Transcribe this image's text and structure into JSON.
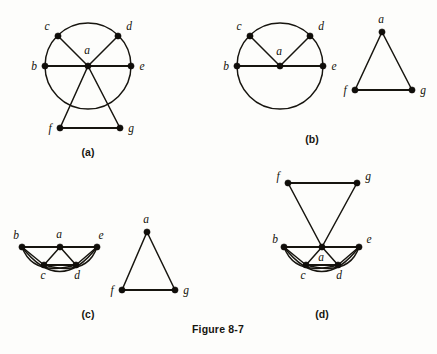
{
  "page": {
    "caption": "Figure 8-7",
    "background_color": "#fdfdfb",
    "ink_color": "#17150f"
  },
  "panels": [
    {
      "id": "a",
      "subcaption": "(a)",
      "description": "Circle through b, c, d, e with hub a at center; a joined to b, c, d, e and to f, g below; f-g edge",
      "vertices": [
        {
          "name": "a",
          "label": "a"
        },
        {
          "name": "b",
          "label": "b"
        },
        {
          "name": "c",
          "label": "c"
        },
        {
          "name": "d",
          "label": "d"
        },
        {
          "name": "e",
          "label": "e"
        },
        {
          "name": "f",
          "label": "f"
        },
        {
          "name": "g",
          "label": "g"
        }
      ],
      "edges": [
        "a-b",
        "a-c",
        "a-d",
        "a-e",
        "a-f",
        "a-g",
        "f-g",
        "circle b-c-d-e"
      ]
    },
    {
      "id": "b",
      "subcaption": "(b)",
      "description": "Left component: circle through b, c, d, e with hub a joined to b, c, d, e. Right component: triangle a, f, g",
      "vertices": [
        {
          "name": "a",
          "label": "a"
        },
        {
          "name": "b",
          "label": "b"
        },
        {
          "name": "c",
          "label": "c"
        },
        {
          "name": "d",
          "label": "d"
        },
        {
          "name": "e",
          "label": "e"
        },
        {
          "name": "a2",
          "label": "a"
        },
        {
          "name": "f",
          "label": "f"
        },
        {
          "name": "g",
          "label": "g"
        }
      ],
      "edges": [
        "a-b",
        "a-c",
        "a-d",
        "a-e",
        "circle b-c-d-e",
        "a-f",
        "a-g",
        "f-g"
      ]
    },
    {
      "id": "c",
      "subcaption": "(c)",
      "description": "Left component: b, a, e collinear on top; c, d below; zigzag plus arcs. Right component: triangle a, f, g",
      "vertices": [
        {
          "name": "b",
          "label": "b"
        },
        {
          "name": "a",
          "label": "a"
        },
        {
          "name": "e",
          "label": "e"
        },
        {
          "name": "c",
          "label": "c"
        },
        {
          "name": "d",
          "label": "d"
        },
        {
          "name": "a2",
          "label": "a"
        },
        {
          "name": "f",
          "label": "f"
        },
        {
          "name": "g",
          "label": "g"
        }
      ],
      "edges": [
        "b-a",
        "a-e",
        "b-c",
        "c-a",
        "a-d",
        "d-e",
        "c-d",
        "arc b-d",
        "arc c-e",
        "arc b-e",
        "a-f",
        "a-g",
        "f-g"
      ]
    },
    {
      "id": "d",
      "subcaption": "(d)",
      "description": "f-g edge on top, both joined down to hub a; b, a, e collinear; c, d below with arcs",
      "vertices": [
        {
          "name": "f",
          "label": "f"
        },
        {
          "name": "g",
          "label": "g"
        },
        {
          "name": "b",
          "label": "b"
        },
        {
          "name": "a",
          "label": "a"
        },
        {
          "name": "e",
          "label": "e"
        },
        {
          "name": "c",
          "label": "c"
        },
        {
          "name": "d",
          "label": "d"
        }
      ],
      "edges": [
        "f-g",
        "f-a",
        "g-a",
        "b-a",
        "a-e",
        "b-c",
        "c-a",
        "a-d",
        "d-e",
        "c-d",
        "arc b-d",
        "arc c-e",
        "arc b-e"
      ]
    }
  ]
}
